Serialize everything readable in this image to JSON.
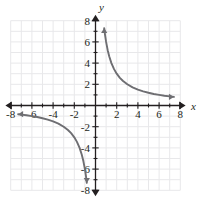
{
  "figure": {
    "background_color": "#ffffff",
    "grid_color": "#e8e8ea",
    "axis_color": "#231f20",
    "curve_color": "#6e6e72",
    "x_axis_label": "x",
    "y_axis_label": "y"
  },
  "chart_data": {
    "type": "line",
    "title": "",
    "xlabel": "x",
    "ylabel": "y",
    "xlim": [
      -8.8,
      8.8
    ],
    "ylim": [
      -8.8,
      8.8
    ],
    "grid": true,
    "grid_step": 1,
    "grid_extent": [
      -8,
      8,
      -8,
      8
    ],
    "legend": "none",
    "x_ticks": [
      -8,
      -6,
      -4,
      -2,
      2,
      4,
      6,
      8
    ],
    "x_tick_labels": [
      "-8",
      "-6",
      "-4",
      "-2",
      "2",
      "4",
      "6",
      "8"
    ],
    "y_ticks": [
      8,
      6,
      4,
      2,
      -2,
      -4,
      -6,
      -8
    ],
    "y_tick_labels": [
      "8",
      "6",
      "4",
      "2",
      "-2",
      "-4",
      "-6",
      "-8"
    ],
    "minor_tick_step": 1,
    "function": "y = 6/x",
    "k": 6,
    "series": [
      {
        "name": "branch-upper-right",
        "arrow_start": "up",
        "arrow_end": "right",
        "x": [
          0.82,
          0.9,
          1.0,
          1.15,
          1.3,
          1.5,
          1.75,
          2.0,
          2.3,
          2.6,
          3.0,
          3.5,
          4.0,
          4.5,
          5.0,
          5.5,
          6.0,
          6.5,
          7.0,
          7.4
        ],
        "y": [
          7.3,
          6.67,
          6.0,
          5.22,
          4.62,
          4.0,
          3.43,
          3.0,
          2.61,
          2.31,
          2.0,
          1.71,
          1.5,
          1.33,
          1.2,
          1.09,
          1.0,
          0.92,
          0.86,
          0.81
        ]
      },
      {
        "name": "branch-lower-left",
        "arrow_start": "left",
        "arrow_end": "down",
        "x": [
          -7.3,
          -7.0,
          -6.5,
          -6.0,
          -5.5,
          -5.0,
          -4.5,
          -4.0,
          -3.5,
          -3.0,
          -2.6,
          -2.3,
          -2.0,
          -1.75,
          -1.5,
          -1.3,
          -1.15,
          -1.0,
          -0.9,
          -0.82
        ],
        "y": [
          -0.82,
          -0.86,
          -0.92,
          -1.0,
          -1.09,
          -1.2,
          -1.33,
          -1.5,
          -1.71,
          -2.0,
          -2.31,
          -2.61,
          -3.0,
          -3.43,
          -4.0,
          -4.62,
          -5.22,
          -6.0,
          -6.67,
          -7.3
        ]
      }
    ]
  }
}
